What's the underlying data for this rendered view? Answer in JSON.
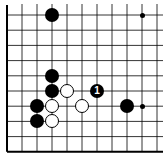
{
  "board": {
    "origin_x": 7,
    "origin_y": 15,
    "spacing_x": 15,
    "spacing_y": 15.2,
    "cols": 11,
    "rows": 10,
    "edges": {
      "left": true,
      "bottom": true,
      "top": false,
      "right": false
    },
    "line_color": "#000000"
  },
  "star_points": [
    {
      "col": 9,
      "row": 0
    },
    {
      "col": 9,
      "row": 6
    }
  ],
  "stones": [
    {
      "color": "black",
      "col": 3,
      "row": 0,
      "label": ""
    },
    {
      "color": "black",
      "col": 3,
      "row": 4,
      "label": ""
    },
    {
      "color": "black",
      "col": 3,
      "row": 5,
      "label": ""
    },
    {
      "color": "white",
      "col": 4,
      "row": 5,
      "label": ""
    },
    {
      "color": "black",
      "col": 6,
      "row": 5,
      "label": "1"
    },
    {
      "color": "black",
      "col": 2,
      "row": 6,
      "label": ""
    },
    {
      "color": "white",
      "col": 3,
      "row": 6,
      "label": ""
    },
    {
      "color": "white",
      "col": 5,
      "row": 6,
      "label": ""
    },
    {
      "color": "black",
      "col": 8,
      "row": 6,
      "label": ""
    },
    {
      "color": "black",
      "col": 2,
      "row": 7,
      "label": ""
    },
    {
      "color": "white",
      "col": 3,
      "row": 7,
      "label": ""
    }
  ]
}
